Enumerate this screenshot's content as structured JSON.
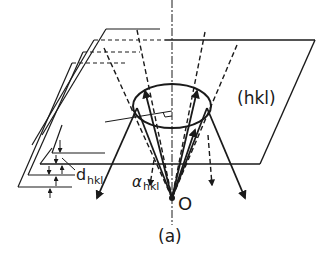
{
  "figure": {
    "plane_label": "(hkl)",
    "spacing_label": "d",
    "spacing_subscript": "hkl",
    "angle_label": "α",
    "angle_subscript": "hkl",
    "origin_label": "O",
    "caption": "(a)"
  },
  "colors": {
    "line": "#1a1a1a",
    "background": "#ffffff"
  }
}
